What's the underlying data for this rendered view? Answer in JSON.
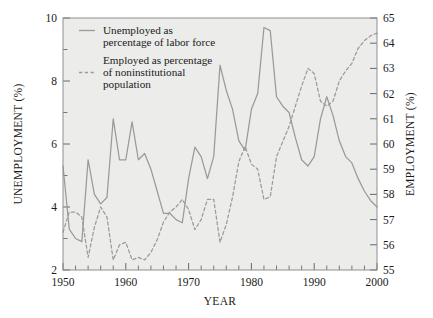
{
  "chart_data": {
    "type": "line",
    "title": "",
    "xlabel": "YEAR",
    "ylabel": "UNEMPLOYMENT (%)",
    "y2label": "EMPLOYMENT (%)",
    "xlim": [
      1950,
      2000
    ],
    "ylim": [
      2,
      10
    ],
    "y2lim": [
      55,
      65
    ],
    "grid": false,
    "legend_position": "top-left-inside",
    "xticks": [
      1950,
      1960,
      1970,
      1980,
      1990,
      2000
    ],
    "xtick_labels": [
      "1950",
      "1960",
      "1970",
      "1980",
      "1990",
      "2000"
    ],
    "xminor_step": 2,
    "yticks": [
      2,
      4,
      6,
      8,
      10
    ],
    "ytick_labels": [
      "2",
      "4",
      "6",
      "8",
      "10"
    ],
    "yminor_step": 1,
    "y2ticks": [
      55,
      56,
      57,
      58,
      59,
      60,
      61,
      62,
      63,
      64,
      65
    ],
    "y2tick_labels": [
      "55",
      "56",
      "57",
      "58",
      "59",
      "60",
      "61",
      "62",
      "63",
      "64",
      "65"
    ],
    "colors": {
      "plot_background": "#ececeb",
      "line": "#9a9a9a",
      "frame": "#8f8f8f",
      "text": "#1a1a1a"
    },
    "series": [
      {
        "name": "Unemployed as percentage of labor force",
        "axis": "left",
        "style": "solid",
        "color": "#9a9a9a",
        "x": [
          1950,
          1951,
          1952,
          1953,
          1954,
          1955,
          1956,
          1957,
          1958,
          1959,
          1960,
          1961,
          1962,
          1963,
          1964,
          1965,
          1966,
          1967,
          1968,
          1969,
          1970,
          1971,
          1972,
          1973,
          1974,
          1975,
          1976,
          1977,
          1978,
          1979,
          1980,
          1981,
          1982,
          1983,
          1984,
          1985,
          1986,
          1987,
          1988,
          1989,
          1990,
          1991,
          1992,
          1993,
          1994,
          1995,
          1996,
          1997,
          1998,
          1999,
          2000
        ],
        "values": [
          5.3,
          3.3,
          3.0,
          2.9,
          5.5,
          4.4,
          4.1,
          4.3,
          6.8,
          5.5,
          5.5,
          6.7,
          5.5,
          5.7,
          5.2,
          4.5,
          3.8,
          3.8,
          3.6,
          3.5,
          4.9,
          5.9,
          5.6,
          4.9,
          5.6,
          8.5,
          7.7,
          7.1,
          6.1,
          5.8,
          7.1,
          7.6,
          9.7,
          9.6,
          7.5,
          7.2,
          7.0,
          6.2,
          5.5,
          5.3,
          5.6,
          6.8,
          7.5,
          6.9,
          6.1,
          5.6,
          5.4,
          4.9,
          4.5,
          4.2,
          4.0
        ]
      },
      {
        "name": "Employed as percentage of noninstitutional population",
        "axis": "right",
        "style": "dashed",
        "color": "#9a9a9a",
        "x": [
          1950,
          1951,
          1952,
          1953,
          1954,
          1955,
          1956,
          1957,
          1958,
          1959,
          1960,
          1961,
          1962,
          1963,
          1964,
          1965,
          1966,
          1967,
          1968,
          1969,
          1970,
          1971,
          1972,
          1973,
          1974,
          1975,
          1976,
          1977,
          1978,
          1979,
          1980,
          1981,
          1982,
          1983,
          1984,
          1985,
          1986,
          1987,
          1988,
          1989,
          1990,
          1991,
          1992,
          1993,
          1994,
          1995,
          1996,
          1997,
          1998,
          1999,
          2000
        ],
        "values": [
          56.5,
          57.3,
          57.3,
          57.1,
          55.5,
          56.7,
          57.5,
          57.1,
          55.4,
          56.0,
          56.1,
          55.4,
          55.5,
          55.4,
          55.7,
          56.2,
          56.9,
          57.3,
          57.5,
          57.8,
          57.4,
          56.6,
          57.0,
          57.8,
          57.8,
          56.1,
          56.8,
          57.9,
          59.3,
          59.9,
          59.2,
          59.0,
          57.8,
          57.9,
          59.5,
          60.1,
          60.7,
          61.5,
          62.3,
          63.0,
          62.8,
          61.7,
          61.5,
          61.7,
          62.5,
          62.9,
          63.2,
          63.8,
          64.1,
          64.3,
          64.4
        ]
      }
    ],
    "legend": [
      {
        "label_line1": "Unemployed as",
        "label_line2": "percentage of labor force",
        "style": "solid"
      },
      {
        "label_line1": "Employed as percentage",
        "label_line2": "of noninstitutional",
        "label_line3": "population",
        "style": "dashed"
      }
    ]
  }
}
